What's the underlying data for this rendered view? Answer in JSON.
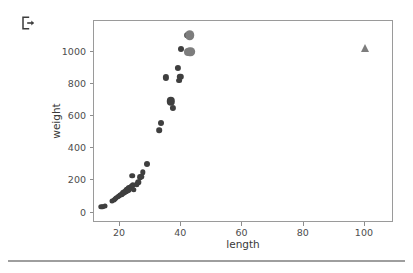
{
  "toolbar": {
    "export_icon": "export-icon"
  },
  "chart_data": {
    "type": "scatter",
    "title": "",
    "xlabel": "length",
    "ylabel": "weight",
    "xlim": [
      11.5,
      109.5
    ],
    "ylim": [
      -65,
      1190
    ],
    "grid": false,
    "legend": null,
    "xticks": [
      20,
      40,
      60,
      80,
      100
    ],
    "yticks": [
      0,
      200,
      400,
      600,
      800,
      1000
    ],
    "xticklabels": [
      "20",
      "40",
      "60",
      "80",
      "100"
    ],
    "yticklabels": [
      "0",
      "200",
      "400",
      "600",
      "800",
      "1000"
    ],
    "colors": {
      "primary_marker": "#3f3f3f",
      "secondary_marker": "#7d7d7d",
      "axis": "#9a9a9a",
      "tick_label": "#4d4d4d",
      "separator": "#9e9e9e"
    },
    "series": [
      {
        "name": "primary",
        "marker": "circle",
        "color": "#3f3f3f",
        "points": [
          {
            "x": 13.9,
            "y": 35,
            "s": 5.4
          },
          {
            "x": 14.3,
            "y": 36,
            "s": 5.4
          },
          {
            "x": 15.1,
            "y": 40,
            "s": 5.0
          },
          {
            "x": 17.4,
            "y": 70,
            "s": 5.0
          },
          {
            "x": 17.9,
            "y": 78,
            "s": 5.0
          },
          {
            "x": 18.3,
            "y": 84,
            "s": 5.0
          },
          {
            "x": 18.8,
            "y": 90,
            "s": 5.0
          },
          {
            "x": 19.2,
            "y": 96,
            "s": 5.4
          },
          {
            "x": 19.6,
            "y": 103,
            "s": 5.0
          },
          {
            "x": 20.0,
            "y": 107,
            "s": 5.0
          },
          {
            "x": 20.4,
            "y": 112,
            "s": 5.4
          },
          {
            "x": 20.7,
            "y": 115,
            "s": 5.0
          },
          {
            "x": 21.0,
            "y": 120,
            "s": 6.0
          },
          {
            "x": 21.4,
            "y": 125,
            "s": 5.4
          },
          {
            "x": 21.8,
            "y": 128,
            "s": 5.4
          },
          {
            "x": 22.0,
            "y": 132,
            "s": 6.2
          },
          {
            "x": 22.3,
            "y": 138,
            "s": 6.4
          },
          {
            "x": 22.5,
            "y": 142,
            "s": 6.2
          },
          {
            "x": 22.8,
            "y": 145,
            "s": 6.6
          },
          {
            "x": 23.0,
            "y": 150,
            "s": 6.2
          },
          {
            "x": 23.3,
            "y": 155,
            "s": 5.6
          },
          {
            "x": 23.6,
            "y": 160,
            "s": 5.6
          },
          {
            "x": 23.9,
            "y": 166,
            "s": 5.6
          },
          {
            "x": 24.1,
            "y": 172,
            "s": 5.4
          },
          {
            "x": 24.0,
            "y": 230,
            "s": 5.6
          },
          {
            "x": 24.6,
            "y": 140,
            "s": 5.4
          },
          {
            "x": 25.4,
            "y": 175,
            "s": 5.4
          },
          {
            "x": 26.0,
            "y": 188,
            "s": 5.4
          },
          {
            "x": 26.6,
            "y": 218,
            "s": 5.8
          },
          {
            "x": 27.0,
            "y": 222,
            "s": 5.4
          },
          {
            "x": 27.5,
            "y": 250,
            "s": 5.4
          },
          {
            "x": 28.7,
            "y": 300,
            "s": 6.0
          },
          {
            "x": 32.8,
            "y": 510,
            "s": 5.6
          },
          {
            "x": 33.5,
            "y": 556,
            "s": 6.0
          },
          {
            "x": 35.0,
            "y": 840,
            "s": 6.2
          },
          {
            "x": 36.6,
            "y": 690,
            "s": 8.4
          },
          {
            "x": 37.4,
            "y": 650,
            "s": 6.2
          },
          {
            "x": 38.8,
            "y": 900,
            "s": 6.2
          },
          {
            "x": 39.4,
            "y": 820,
            "s": 5.8
          },
          {
            "x": 39.7,
            "y": 845,
            "s": 6.4
          },
          {
            "x": 39.8,
            "y": 1015,
            "s": 6.0
          },
          {
            "x": 42.0,
            "y": 1100,
            "s": 5.6
          }
        ]
      },
      {
        "name": "secondary",
        "marker": "circle",
        "color": "#7d7d7d",
        "points": [
          {
            "x": 42.8,
            "y": 1100,
            "s": 9.6
          },
          {
            "x": 43.0,
            "y": 1000,
            "s": 9.6
          },
          {
            "x": 42.2,
            "y": 1000,
            "s": 8.0
          }
        ]
      },
      {
        "name": "outlier",
        "marker": "triangle",
        "color": "#7d7d7d",
        "points": [
          {
            "x": 100.0,
            "y": 1020,
            "s": 8.0
          }
        ]
      }
    ]
  }
}
